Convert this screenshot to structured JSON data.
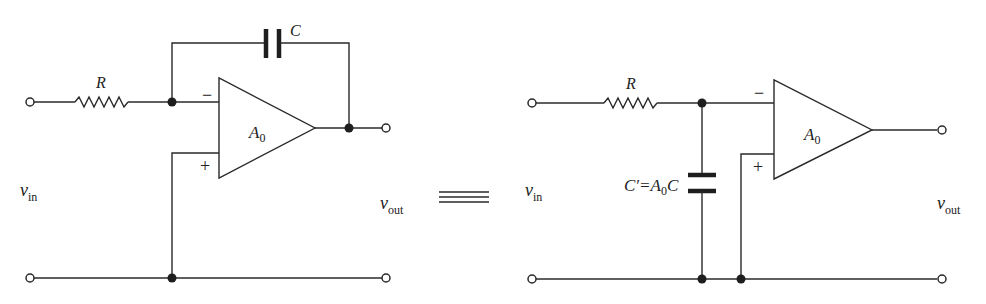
{
  "left_circuit": {
    "resistor_label": "R",
    "capacitor_label": "C",
    "opamp_gain_main": "A",
    "opamp_gain_sub": "0",
    "minus_sign": "−",
    "plus_sign": "+",
    "vin_main": "v",
    "vin_sub": "in",
    "vout_main": "v",
    "vout_sub": "out"
  },
  "equivalence_symbol": "≡",
  "right_circuit": {
    "resistor_label": "R",
    "capacitor_label_prefix": "C′=A",
    "capacitor_label_sub": "0",
    "capacitor_label_suffix": "C",
    "opamp_gain_main": "A",
    "opamp_gain_sub": "0",
    "minus_sign": "−",
    "plus_sign": "+",
    "vin_main": "v",
    "vin_sub": "in",
    "vout_main": "v",
    "vout_sub": "out"
  }
}
